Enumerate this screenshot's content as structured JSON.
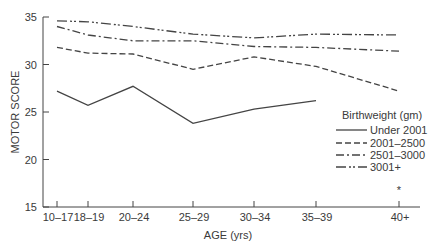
{
  "chart_data": {
    "type": "line",
    "title": "",
    "xlabel": "AGE (yrs)",
    "ylabel": "MOTOR SCORE",
    "categories": [
      "10–17",
      "18–19",
      "20–24",
      "25–29",
      "30–34",
      "35–39",
      "40+"
    ],
    "ylim": [
      15,
      35
    ],
    "yticks": [
      "15",
      "20",
      "25",
      "30",
      "35"
    ],
    "grid": false,
    "legend": {
      "title": "Birthweight (gm)",
      "placement": "right"
    },
    "series": [
      {
        "name": "Under 2001",
        "style": "solid",
        "values": [
          27.2,
          25.7,
          27.7,
          23.8,
          25.3,
          26.2,
          null
        ]
      },
      {
        "name": "2001–2500",
        "style": "dashed",
        "values": [
          31.8,
          31.2,
          31.1,
          29.5,
          30.8,
          29.8,
          27.2
        ]
      },
      {
        "name": "2501–3000",
        "style": "dash-dot",
        "values": [
          34.0,
          33.1,
          32.5,
          32.5,
          31.9,
          31.8,
          31.4
        ]
      },
      {
        "name": "3001+",
        "style": "dash-dot-dot",
        "values": [
          34.6,
          34.5,
          34.0,
          33.2,
          32.8,
          33.2,
          33.1
        ]
      }
    ],
    "annotations": [
      {
        "text": "*",
        "category": "40+"
      }
    ],
    "line_color": "#444444"
  }
}
